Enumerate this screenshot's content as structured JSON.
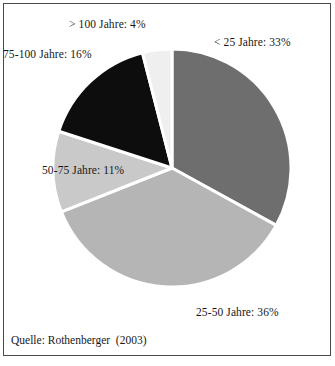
{
  "figure": {
    "source_caption": "Quelle: Rothenberger  (2003)",
    "frame_color": "#4a4a4a",
    "background": "#ffffff",
    "separator_color": "#ffffff"
  },
  "chart_data": {
    "type": "pie",
    "title": "",
    "categories": [
      "< 25 Jahre",
      "25-50 Jahre",
      "50-75 Jahre",
      "75-100 Jahre",
      "> 100 Jahre"
    ],
    "values": [
      33,
      36,
      11,
      16,
      4
    ],
    "value_unit": "%",
    "start_angle_deg": 0,
    "direction": "clockwise",
    "legend": "none",
    "grid": false,
    "colors": [
      "#6e6e6e",
      "#b5b5b5",
      "#c9c9c9",
      "#0d0d0d",
      "#efefef"
    ],
    "labels": [
      {
        "text": "< 25 Jahre:  33%",
        "category": "< 25 Jahre",
        "value": 33,
        "color": "#6e6e6e"
      },
      {
        "text": "25-50 Jahre:  36%",
        "category": "25-50 Jahre",
        "value": 36,
        "color": "#b5b5b5"
      },
      {
        "text": "50-75 Jahre:  11%",
        "category": "50-75 Jahre",
        "value": 11,
        "color": "#c9c9c9"
      },
      {
        "text": "75-100 Jahre:  16%",
        "category": "75-100 Jahre",
        "value": 16,
        "color": "#0d0d0d"
      },
      {
        "text": "> 100 Jahre:  4%",
        "category": "> 100 Jahre",
        "value": 4,
        "color": "#efefef"
      }
    ]
  }
}
